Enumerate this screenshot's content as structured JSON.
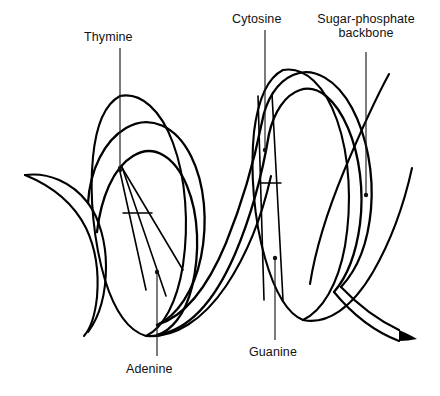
{
  "figure": {
    "style": "black-and-white line art",
    "background_color": "#ffffff",
    "line_color": "#000000",
    "width": 440,
    "height": 396
  },
  "labels": [
    {
      "id": "thymine",
      "text": "Thymine",
      "lines": [
        "Thymine"
      ],
      "position": "top-left",
      "x": 84,
      "y": 30,
      "leader": {
        "x1": 120,
        "y1": 48,
        "x2": 120,
        "y2": 170,
        "dot_x": 120,
        "dot_y": 170
      }
    },
    {
      "id": "cytosine",
      "text": "Cytosine",
      "lines": [
        "Cytosine"
      ],
      "position": "top-center",
      "x": 232,
      "y": 12,
      "leader": {
        "x1": 265,
        "y1": 30,
        "x2": 265,
        "y2": 150,
        "dot_x": 265,
        "dot_y": 150
      }
    },
    {
      "id": "sugar-phosphate-backbone",
      "text": "Sugar-phosphate backbone",
      "lines": [
        "Sugar-phosphate",
        "backbone"
      ],
      "position": "top-right",
      "x": 314,
      "y": 12,
      "leader": {
        "x1": 366,
        "y1": 52,
        "x2": 366,
        "y2": 195,
        "dot_x": 366,
        "dot_y": 195
      }
    },
    {
      "id": "adenine",
      "text": "Adenine",
      "lines": [
        "Adenine"
      ],
      "position": "bottom-left",
      "x": 126,
      "y": 362,
      "leader": {
        "x1": 157,
        "y1": 272,
        "x2": 157,
        "y2": 356,
        "dot_x": 157,
        "dot_y": 272
      }
    },
    {
      "id": "guanine",
      "text": "Guanine",
      "lines": [
        "Guanine"
      ],
      "position": "bottom-center",
      "x": 249,
      "y": 345,
      "leader": {
        "x1": 275,
        "y1": 258,
        "x2": 275,
        "y2": 340,
        "dot_x": 275,
        "dot_y": 258
      }
    }
  ],
  "diagram_parts": {
    "helix_turns": 2,
    "base_pair_rungs": 2,
    "strands": 2,
    "description": "Two antiparallel sugar-phosphate backbone ribbons coiled into a double helix with base pairs shown as rungs between the strands."
  }
}
